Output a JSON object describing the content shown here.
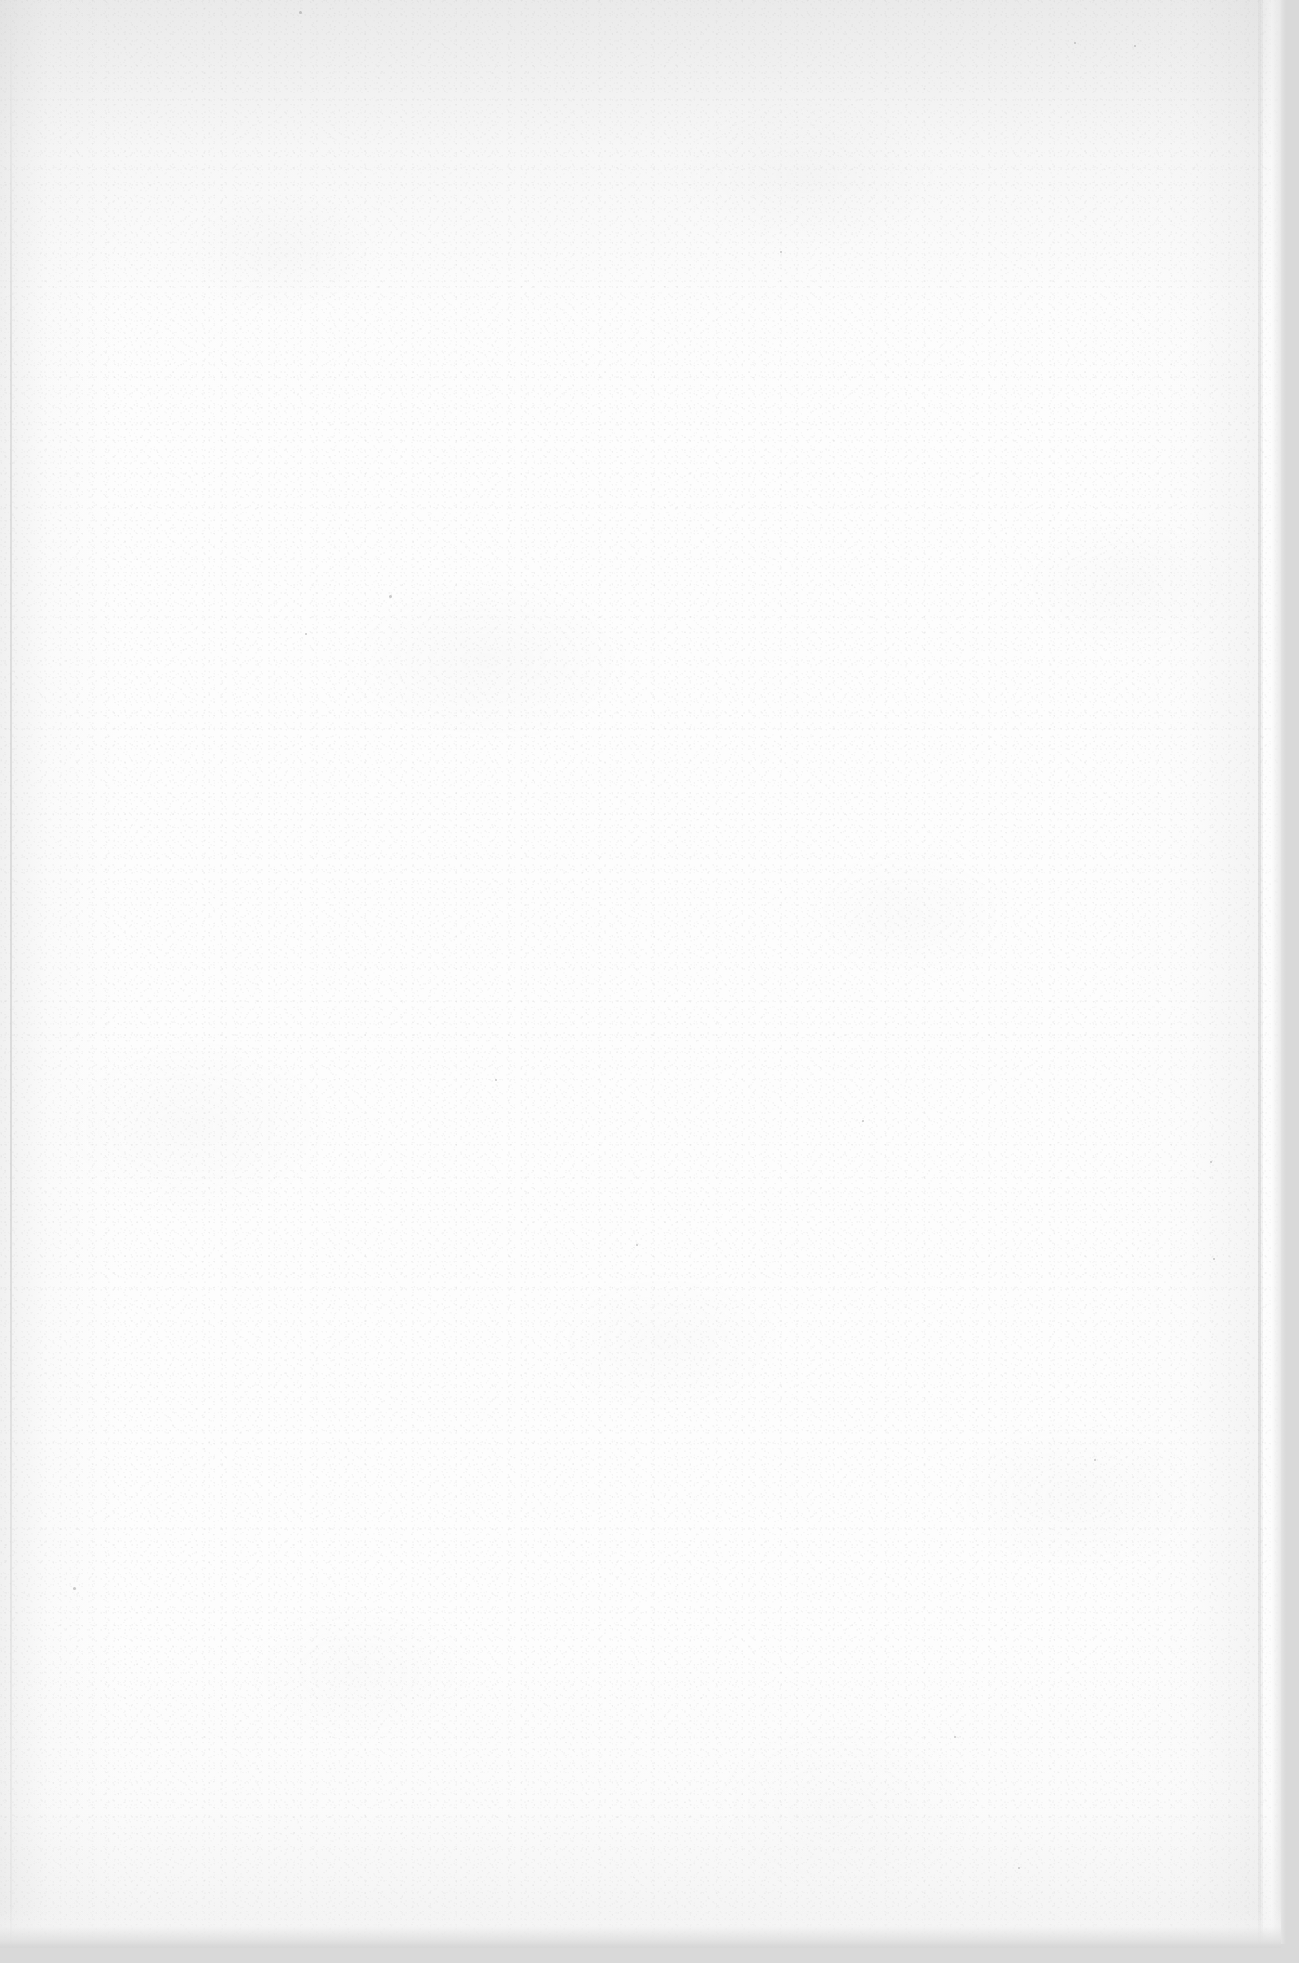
{
  "document": {
    "kind": "scanned-blank-page",
    "page_content_text": "",
    "visible_text_elements": [],
    "orientation": "portrait",
    "page_width_px": 1299,
    "page_height_px": 1963
  },
  "appearance": {
    "paper_color": "#fdfdfd",
    "scanner_background_color": "#d9d9d9",
    "grain_tone_color": "#9a9a9a",
    "edge_shadow_color": "#c8c8c8",
    "vignette_color": "#bebebe"
  },
  "regions": {
    "paper_left_px": 0,
    "paper_top_px": 0,
    "paper_right_px": 1281,
    "paper_bottom_px": 1944,
    "right_edge_shadow_start_px": 1264,
    "bottom_edge_shadow_start_px": 1908,
    "left_crease_x_px": 10,
    "right_crease_x_px": 1258
  },
  "specks": [
    {
      "x": 299,
      "y": 11,
      "size": 3
    },
    {
      "x": 389,
      "y": 595,
      "size": 3
    },
    {
      "x": 305,
      "y": 633,
      "size": 2
    },
    {
      "x": 1134,
      "y": 45,
      "size": 2
    },
    {
      "x": 1074,
      "y": 42,
      "size": 2
    },
    {
      "x": 862,
      "y": 1120,
      "size": 2
    },
    {
      "x": 1210,
      "y": 1161,
      "size": 2
    },
    {
      "x": 73,
      "y": 1587,
      "size": 3
    },
    {
      "x": 1213,
      "y": 1258,
      "size": 2
    },
    {
      "x": 954,
      "y": 1736,
      "size": 2
    },
    {
      "x": 636,
      "y": 1244,
      "size": 2
    },
    {
      "x": 1018,
      "y": 1867,
      "size": 2
    },
    {
      "x": 495,
      "y": 1079,
      "size": 2
    },
    {
      "x": 780,
      "y": 251,
      "size": 2
    },
    {
      "x": 1094,
      "y": 1459,
      "size": 2
    }
  ]
}
